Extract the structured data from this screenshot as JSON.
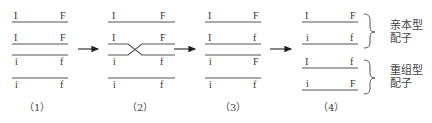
{
  "diagram": {
    "panels": [
      {
        "caption": "（1）",
        "chromatids": [
          {
            "left": "I",
            "right": "F"
          },
          {
            "left": "I",
            "right": "F"
          },
          {
            "left": "i",
            "right": "f"
          },
          {
            "left": "i",
            "right": "f"
          }
        ]
      },
      {
        "caption": "（2）",
        "chromatids": [
          {
            "left": "I",
            "right": "F"
          },
          {
            "left": "I",
            "right": "F"
          },
          {
            "left": "i",
            "right": "f"
          },
          {
            "left": "i",
            "right": "f"
          }
        ],
        "crossover": "between chromatid 2 and 3"
      },
      {
        "caption": "（3）",
        "chromatids": [
          {
            "left": "I",
            "right": "F"
          },
          {
            "left": "I",
            "right": "f"
          },
          {
            "left": "i",
            "right": "F"
          },
          {
            "left": "i",
            "right": "f"
          }
        ]
      },
      {
        "caption": "（4）",
        "gametes": [
          {
            "left": "I",
            "right": "F"
          },
          {
            "left": "i",
            "right": "f"
          },
          {
            "left": "I",
            "right": "f"
          },
          {
            "left": "i",
            "right": "F"
          }
        ]
      }
    ],
    "groups": [
      {
        "line1": "亲本型",
        "line2": "配子"
      },
      {
        "line1": "重组型",
        "line2": "配子"
      }
    ],
    "arrows": [
      "→",
      "→",
      "→"
    ]
  }
}
